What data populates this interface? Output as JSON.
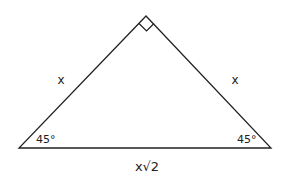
{
  "diagram": {
    "stroke_color": "#222222",
    "background": "#ffffff",
    "labels": {
      "left_leg": "x",
      "right_leg": "x",
      "hypotenuse": "x√2",
      "left_angle": "45°",
      "right_angle": "45°"
    },
    "vertices": {
      "apex": [
        146,
        16
      ],
      "left": [
        19,
        148
      ],
      "right": [
        271,
        148
      ]
    },
    "right_angle_marker": "apex"
  }
}
